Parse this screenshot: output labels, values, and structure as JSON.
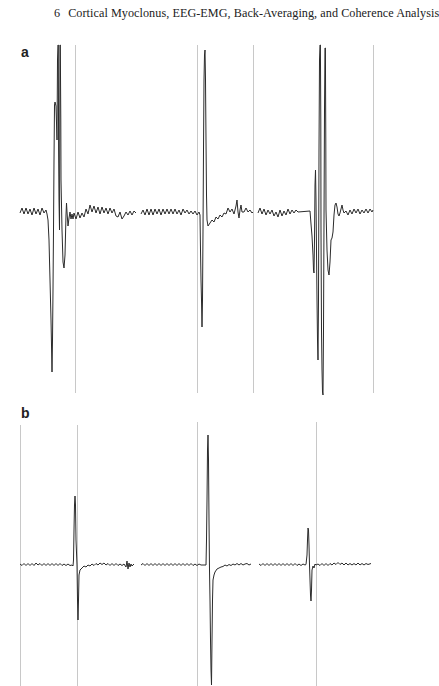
{
  "running_head": {
    "chapter_number": "6",
    "title": "Cortical Myoclonus, EEG-EMG, Back-Averaging, and Coherence Analysis"
  },
  "figure": {
    "panels": [
      {
        "label": "a",
        "description": "Three back-averaged EEG traces with large sharp transients (giant cortical potentials) time-locked to vertical marker lines",
        "trace_color": "#2b2b2b",
        "marker_color": "#c8c8c8",
        "segments": 3
      },
      {
        "label": "b",
        "description": "Three back-averaged traces with smaller biphasic transients time-locked to vertical marker lines",
        "trace_color": "#2b2b2b",
        "marker_color": "#c8c8c8",
        "segments": 3
      }
    ]
  }
}
